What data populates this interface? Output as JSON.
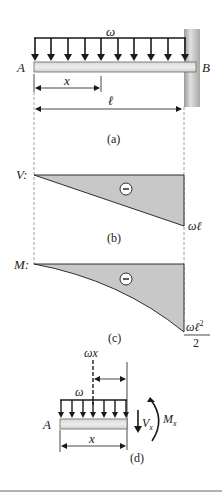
{
  "figure": {
    "panel_a": {
      "load_label": "ω",
      "end_left": "A",
      "end_right": "B",
      "dim_x": "x",
      "dim_length": "ℓ",
      "caption": "(a)"
    },
    "panel_b": {
      "axis_label": "V:",
      "sign": "−",
      "end_value": "ωℓ",
      "caption": "(b)"
    },
    "panel_c": {
      "axis_label": "M:",
      "sign": "−",
      "end_value_num": "ωℓ",
      "end_value_exp": "2",
      "end_value_den": "2",
      "caption": "(c)"
    },
    "panel_d": {
      "resultant_label": "ωx",
      "load_label": "ω",
      "end_left": "A",
      "dim_x": "x",
      "shear_label": "V",
      "shear_sub": "x",
      "moment_label": "M",
      "moment_sub": "x",
      "caption": "(d)"
    },
    "colors": {
      "line": "#1a1a1a",
      "fill": "#c8c8c8",
      "beam": "#e2e2e2",
      "wall": "#b8b8b8",
      "dash": "#888888"
    }
  }
}
